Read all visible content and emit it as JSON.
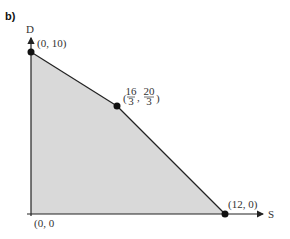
{
  "figure": {
    "part_label": "b)",
    "y_axis_label": "D",
    "x_axis_label": "S",
    "shade_color": "#d9d9d9",
    "line_color": "#222222",
    "points": [
      {
        "label": "(0, 10)",
        "S": 0,
        "D": 10
      },
      {
        "label_num1": "16",
        "label_den1": "3",
        "label_num2": "20",
        "label_den2": "3",
        "S": 5.333,
        "D": 6.667
      },
      {
        "label": "(12, 0)",
        "S": 12,
        "D": 0
      },
      {
        "label": "(0, 0",
        "S": 0,
        "D": 0
      }
    ],
    "region": "Feasible region bounded by (0,0), (0,10), (16/3, 20/3), (12,0)"
  }
}
